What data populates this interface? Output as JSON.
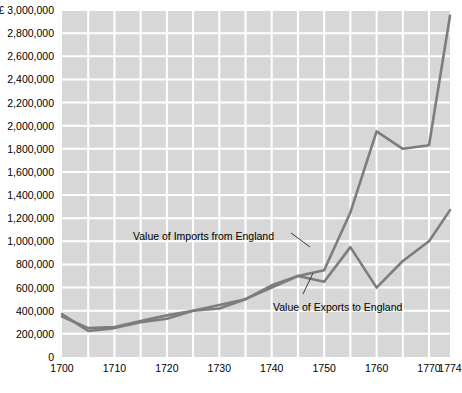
{
  "chart_data": {
    "type": "line",
    "title": "",
    "xlabel": "",
    "ylabel": "",
    "currency_symbol": "£",
    "xlim": [
      1700,
      1774
    ],
    "ylim": [
      0,
      3000000
    ],
    "grid": true,
    "legend": "annotations-inline",
    "y_ticks": [
      {
        "value": 3000000,
        "label": "£ 3,000,000"
      },
      {
        "value": 2800000,
        "label": "2,800,000"
      },
      {
        "value": 2600000,
        "label": "2,600,000"
      },
      {
        "value": 2400000,
        "label": "2,400,000"
      },
      {
        "value": 2200000,
        "label": "2,200,000"
      },
      {
        "value": 2000000,
        "label": "2,000,000"
      },
      {
        "value": 1800000,
        "label": "1,800,000"
      },
      {
        "value": 1600000,
        "label": "1,600,000"
      },
      {
        "value": 1400000,
        "label": "1,400,000"
      },
      {
        "value": 1200000,
        "label": "1,200,000"
      },
      {
        "value": 1000000,
        "label": "1,000,000"
      },
      {
        "value": 800000,
        "label": "800,000"
      },
      {
        "value": 600000,
        "label": "600,000"
      },
      {
        "value": 400000,
        "label": "400,000"
      },
      {
        "value": 200000,
        "label": "200,000"
      },
      {
        "value": 0,
        "label": "0"
      }
    ],
    "x_ticks": [
      {
        "value": 1700,
        "label": "1700"
      },
      {
        "value": 1710,
        "label": "1710"
      },
      {
        "value": 1720,
        "label": "1720"
      },
      {
        "value": 1730,
        "label": "1730"
      },
      {
        "value": 1740,
        "label": "1740"
      },
      {
        "value": 1750,
        "label": "1750"
      },
      {
        "value": 1760,
        "label": "1760"
      },
      {
        "value": 1770,
        "label": "1770"
      },
      {
        "value": 1774,
        "label": "1774"
      }
    ],
    "series": [
      {
        "name": "Value of Imports from England",
        "color": "#7d7d7d",
        "points": [
          [
            1700,
            370000
          ],
          [
            1705,
            225000
          ],
          [
            1710,
            250000
          ],
          [
            1715,
            300000
          ],
          [
            1720,
            330000
          ],
          [
            1725,
            400000
          ],
          [
            1730,
            420000
          ],
          [
            1735,
            500000
          ],
          [
            1740,
            600000
          ],
          [
            1745,
            700000
          ],
          [
            1750,
            750000
          ],
          [
            1755,
            1250000
          ],
          [
            1760,
            1950000
          ],
          [
            1765,
            1800000
          ],
          [
            1770,
            1830000
          ],
          [
            1774,
            2950000
          ]
        ]
      },
      {
        "name": "Value of Exports to England",
        "color": "#7d7d7d",
        "points": [
          [
            1700,
            350000
          ],
          [
            1705,
            250000
          ],
          [
            1710,
            260000
          ],
          [
            1715,
            310000
          ],
          [
            1720,
            360000
          ],
          [
            1725,
            400000
          ],
          [
            1730,
            450000
          ],
          [
            1735,
            500000
          ],
          [
            1740,
            620000
          ],
          [
            1745,
            700000
          ],
          [
            1750,
            650000
          ],
          [
            1755,
            950000
          ],
          [
            1760,
            600000
          ],
          [
            1765,
            830000
          ],
          [
            1770,
            1000000
          ],
          [
            1774,
            1270000
          ]
        ]
      }
    ],
    "annotations": [
      {
        "id": "imports-label",
        "text": "Value of Imports from England",
        "x_px": 133,
        "y_px": 230,
        "leader": {
          "x1": 291,
          "y1": 233,
          "x2": 310,
          "y2": 247
        }
      },
      {
        "id": "exports-label",
        "text": "Value of Exports to England",
        "x_px": 273,
        "y_px": 301,
        "leader": {
          "x1": 303,
          "y1": 294,
          "x2": 313,
          "y2": 273
        }
      }
    ]
  },
  "caption": {
    "text": ""
  }
}
